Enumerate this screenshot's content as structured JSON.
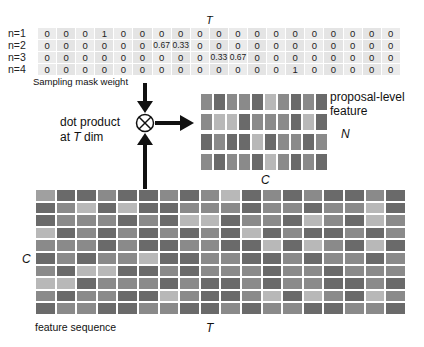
{
  "mask_table": {
    "axis_label": "T",
    "caption": "Sampling mask weight",
    "rows": [
      {
        "label": "n=1",
        "values": [
          "0",
          "0",
          "0",
          "1",
          "0",
          "0",
          "0",
          "0",
          "0",
          "0",
          "0",
          "0",
          "0",
          "0",
          "0",
          "0",
          "0",
          "0",
          "0"
        ]
      },
      {
        "label": "n=2",
        "values": [
          "0",
          "0",
          "0",
          "0",
          "0",
          "0",
          "0.67",
          "0.33",
          "0",
          "0",
          "0",
          "0",
          "0",
          "0",
          "0",
          "0",
          "0",
          "0",
          "0"
        ]
      },
      {
        "label": "n=3",
        "values": [
          "0",
          "0",
          "0",
          "0",
          "0",
          "0",
          "0",
          "0",
          "0",
          "0.33",
          "0.67",
          "0",
          "0",
          "0",
          "0",
          "0",
          "0",
          "0",
          "0"
        ]
      },
      {
        "label": "n=4",
        "values": [
          "0",
          "0",
          "0",
          "0",
          "0",
          "0",
          "0",
          "0",
          "0",
          "0",
          "0",
          "0",
          "0",
          "1",
          "0",
          "0",
          "0",
          "0",
          "0"
        ]
      }
    ]
  },
  "operation": {
    "line1": "dot product",
    "line2_prefix": "at ",
    "line2_var": "T",
    "line2_suffix": " dim",
    "symbol": "⊗"
  },
  "proposal_feature": {
    "title_line1": "proposal-level",
    "title_line2": "feature",
    "row_axis_label": "N",
    "col_axis_label": "C",
    "rows": 4,
    "cols": 10,
    "shades": [
      [
        1,
        2,
        1,
        1,
        2,
        0,
        1,
        2,
        1,
        2
      ],
      [
        1,
        0,
        0,
        2,
        1,
        1,
        1,
        2,
        0,
        2
      ],
      [
        2,
        1,
        2,
        2,
        0,
        2,
        1,
        1,
        2,
        1
      ],
      [
        1,
        2,
        1,
        1,
        2,
        0,
        1,
        2,
        1,
        2
      ]
    ]
  },
  "feature_sequence": {
    "caption": "feature sequence",
    "row_axis_label": "C",
    "col_axis_label": "T",
    "rows": 10,
    "cols": 18,
    "shades": [
      [
        3,
        2,
        2,
        1,
        2,
        2,
        1,
        2,
        1,
        0,
        2,
        1,
        2,
        1,
        2,
        2,
        1,
        2
      ],
      [
        2,
        1,
        0,
        2,
        0,
        2,
        2,
        1,
        1,
        1,
        2,
        1,
        1,
        2,
        1,
        1,
        0,
        2
      ],
      [
        2,
        1,
        1,
        1,
        2,
        1,
        2,
        0,
        0,
        2,
        1,
        1,
        2,
        0,
        1,
        2,
        0,
        1
      ],
      [
        0,
        2,
        1,
        2,
        1,
        2,
        1,
        2,
        1,
        2,
        0,
        2,
        1,
        2,
        2,
        1,
        2,
        1
      ],
      [
        1,
        1,
        1,
        2,
        1,
        2,
        2,
        1,
        1,
        2,
        2,
        0,
        2,
        0,
        1,
        2,
        0,
        2
      ],
      [
        2,
        1,
        2,
        1,
        1,
        0,
        2,
        2,
        1,
        1,
        2,
        2,
        1,
        2,
        1,
        1,
        2,
        1
      ],
      [
        1,
        2,
        0,
        0,
        2,
        2,
        1,
        2,
        1,
        1,
        1,
        2,
        1,
        1,
        2,
        1,
        1,
        1
      ],
      [
        0,
        0,
        2,
        1,
        1,
        1,
        2,
        1,
        2,
        2,
        1,
        2,
        1,
        1,
        2,
        2,
        1,
        2
      ],
      [
        1,
        2,
        1,
        1,
        2,
        2,
        0,
        1,
        2,
        2,
        1,
        0,
        2,
        0,
        1,
        2,
        0,
        1
      ],
      [
        2,
        1,
        1,
        2,
        2,
        1,
        1,
        2,
        2,
        1,
        2,
        1,
        1,
        2,
        2,
        1,
        1,
        2
      ]
    ]
  }
}
